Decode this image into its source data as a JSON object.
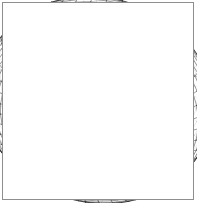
{
  "figure": {
    "caption": "",
    "background_color": "#ffffff",
    "border_color": "#8e8e8e",
    "mesh_color": "#3a3a3a",
    "silhouette_color": "#1a1a1a",
    "hidden_mesh_color": "#9a9a9a"
  },
  "chart_data": {
    "type": "line",
    "title": "",
    "subtitle": "",
    "xlabel": "",
    "ylabel": "",
    "grid": true,
    "legend": null,
    "geometry": "torus",
    "surface": {
      "major_radius_R": 1.0,
      "minor_radius_r": 0.42,
      "u_range_deg": [
        0,
        360
      ],
      "v_range_deg": [
        0,
        360
      ],
      "u_steps": 48,
      "v_steps": 40
    },
    "projection": {
      "type": "orthographic",
      "elevation_deg": 34,
      "azimuth_deg": 24,
      "roll_deg": -16,
      "scale_px": 82,
      "center_px": [
        97,
        100
      ]
    },
    "render": {
      "wireframe": true,
      "hidden_line_removal": true,
      "shading": "none",
      "line_width_px": 0.55
    },
    "extent_px": {
      "x": [
        14,
        181
      ],
      "y": [
        11,
        191
      ]
    },
    "x": [],
    "values": [],
    "categories": []
  }
}
